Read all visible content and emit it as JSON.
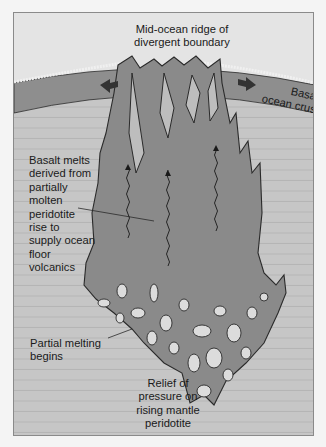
{
  "diagram": {
    "labels": {
      "ridge": [
        "Mid-ocean ridge of",
        "divergent boundary"
      ],
      "crust": [
        "Basalt",
        "ocean crust"
      ],
      "basalt_melts": [
        "Basalt melts",
        "derived from",
        "partially",
        "molten",
        "peridotite",
        "rise to",
        "supply ocean",
        "floor",
        "volcanics"
      ],
      "partial_melting": [
        "Partial melting",
        "begins"
      ],
      "relief": [
        "Relief of",
        "pressure on",
        "rising mantle",
        "peridotite"
      ]
    },
    "icons": [
      "spreading-arrow-left-icon",
      "spreading-arrow-right-icon",
      "rising-melt-arrow-icon"
    ],
    "colors": {
      "sky": "#e4e4e4",
      "crust": "#8e8e8e",
      "mantle": "#c6c6c6",
      "mantle_lines": "#b0b0b0",
      "plume": "#8a8a8a",
      "outline": "#2a2a2a",
      "melt_pockets": "#dcdcdc",
      "arrows": "#333333"
    }
  }
}
